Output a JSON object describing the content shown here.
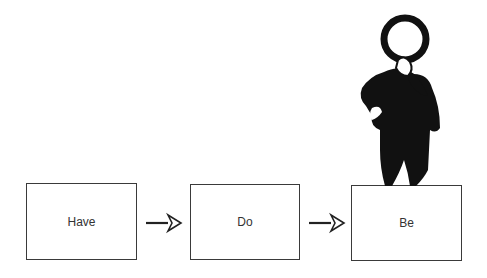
{
  "diagram": {
    "boxes": [
      {
        "label": "Have"
      },
      {
        "label": "Do"
      },
      {
        "label": "Be"
      }
    ],
    "arrows": [
      {
        "from": "Have",
        "to": "Do"
      },
      {
        "from": "Do",
        "to": "Be"
      }
    ],
    "figure": {
      "icon": "thinking-man-icon",
      "stands_on": "Be"
    },
    "colors": {
      "stroke": "#3a3a3a",
      "figure": "#111111",
      "background": "#ffffff"
    }
  }
}
